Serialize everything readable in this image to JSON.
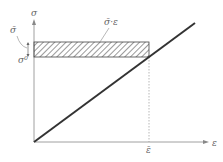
{
  "diagram": {
    "y_axis_label": "σ",
    "x_axis_label": "ε",
    "sigma_bar_label": "σ̄",
    "sigma0_label": "σ⁰",
    "area_label": "σ̄·ε",
    "epsilon_bar_label": "ε̄",
    "colors": {
      "line": "#333333",
      "axis": "#888888",
      "hatch": "#555555"
    }
  }
}
